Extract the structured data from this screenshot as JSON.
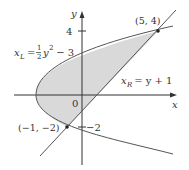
{
  "diagram": {
    "axes": {
      "x_label": "x",
      "y_label": "y",
      "origin_label": "0"
    },
    "ticks": {
      "y_pos": "4",
      "y_neg": "−2"
    },
    "curves": {
      "left": {
        "label_var": "x",
        "label_sub": "L",
        "label_eq": "=",
        "label_frac_num": "1",
        "label_frac_den": "2",
        "label_rest": "y",
        "label_exp": "2",
        "label_tail": " − 3"
      },
      "right": {
        "label_var": "x",
        "label_sub": "R",
        "label_eq": " = y + 1"
      }
    },
    "points": [
      {
        "label": "(5, 4)",
        "x": 5,
        "y": 4
      },
      {
        "label": "(−1, −2)",
        "x": -1,
        "y": -2
      }
    ],
    "colors": {
      "shade": "#d9d9d9",
      "stroke": "#555555",
      "axis": "#333333"
    }
  }
}
